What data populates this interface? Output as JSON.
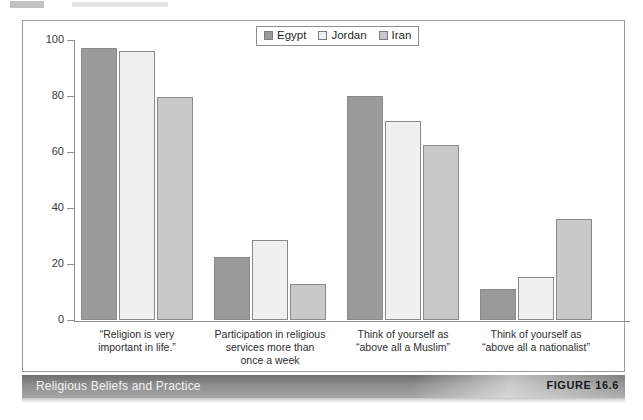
{
  "figure": {
    "caption_title": "Religious Beliefs and Practice",
    "figure_number": "FIGURE 16.6"
  },
  "legend": {
    "entries": [
      {
        "label": "Egypt",
        "color": "#9a9a9a"
      },
      {
        "label": "Jordan",
        "color": "#f0f0f0"
      },
      {
        "label": "Iran",
        "color": "#c9c9c9"
      }
    ]
  },
  "axis": {
    "y_ticks": [
      "100",
      "80",
      "60",
      "40",
      "20",
      "0"
    ]
  },
  "chart_data": {
    "type": "bar",
    "title": "Religious Beliefs and Practice",
    "xlabel": "",
    "ylabel": "",
    "ylim": [
      0,
      100
    ],
    "yticks": [
      0,
      20,
      40,
      60,
      80,
      100
    ],
    "grid": false,
    "legend_position": "top-center",
    "categories": [
      "“Religion is very\nimportant in life.”",
      "Participation in religious\nservices more than\nonce a week",
      "Think of yourself as\n“above all a Muslim”",
      "Think of yourself as\n“above all a nationalist”"
    ],
    "category_lines": [
      [
        "“Religion is very",
        "important in life.”"
      ],
      [
        "Participation in religious",
        "services more than",
        "once a week"
      ],
      [
        "Think of yourself as",
        "“above all a Muslim”"
      ],
      [
        "Think of yourself as",
        "“above all a nationalist”"
      ]
    ],
    "series": [
      {
        "name": "Egypt",
        "color": "#9a9a9a",
        "values": [
          97,
          22.5,
          80,
          11
        ]
      },
      {
        "name": "Jordan",
        "color": "#f0f0f0",
        "values": [
          96,
          28.5,
          71,
          15.5
        ]
      },
      {
        "name": "Iran",
        "color": "#c9c9c9",
        "values": [
          79.5,
          13,
          62.5,
          36
        ]
      }
    ]
  }
}
